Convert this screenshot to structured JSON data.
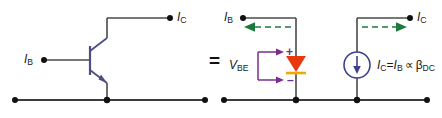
{
  "figure": {
    "equals_sign": "="
  },
  "colors": {
    "wire": "#4a4a4a",
    "rail": "#3c3c3c",
    "transistor": "#4d4f82",
    "diode_body": "#e8380d",
    "diode_bar": "#f0a800",
    "current_source": "#3b3f8c",
    "current_arrow": "#1c7a3e",
    "polarity": "#7b2d8e",
    "node_dot": "#111111",
    "text": "#1a1a1a"
  },
  "left_circuit": {
    "name": "npn-transistor-circuit",
    "base_label": {
      "symbol": "I",
      "subscript": "B"
    },
    "collector_label": {
      "symbol": "I",
      "subscript": "C"
    },
    "device": "npn-bjt"
  },
  "right_circuit": {
    "name": "dc-equivalent-model",
    "base_label": {
      "symbol": "I",
      "subscript": "B"
    },
    "collector_label": {
      "symbol": "I",
      "subscript": "C"
    },
    "vbe_label": {
      "symbol": "V",
      "subscript": "BE"
    },
    "plus_sign": "+",
    "minus_sign": "–",
    "equation": {
      "lhs_symbol": "I",
      "lhs_subscript": "C",
      "equals": "=",
      "rhs_symbol": "I",
      "rhs_subscript": "B",
      "operator": "∝",
      "beta_symbol": "β",
      "beta_subscript": "DC"
    },
    "diode": "base-emitter-diode",
    "source": "dependent-current-source"
  }
}
